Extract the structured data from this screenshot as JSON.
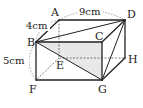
{
  "figure": {
    "type": "rectangular prism (cuboid)",
    "vertices": {
      "A": {
        "label": "A",
        "x": 59,
        "y": 20
      },
      "B": {
        "label": "B",
        "x": 36,
        "y": 42
      },
      "C": {
        "label": "C",
        "x": 102,
        "y": 42
      },
      "D": {
        "label": "D",
        "x": 125,
        "y": 20
      },
      "E": {
        "label": "E",
        "x": 59,
        "y": 58
      },
      "F": {
        "label": "F",
        "x": 36,
        "y": 80
      },
      "G": {
        "label": "G",
        "x": 102,
        "y": 80
      },
      "H": {
        "label": "H",
        "x": 125,
        "y": 58
      }
    },
    "dimensions": {
      "AD": "9cm",
      "AB": "4cm",
      "BF": "5cm"
    },
    "solid_edges": [
      "AD",
      "AB",
      "BC",
      "CD",
      "BF",
      "FG",
      "CG",
      "DH",
      "GH",
      "BD",
      "BG",
      "DG"
    ],
    "hidden_edges": [
      "AE",
      "EF",
      "EH"
    ],
    "shaded_region": "BCG",
    "colors": {
      "line": "#222222",
      "shade": "#e6e6e6",
      "dashed": "#555555"
    }
  }
}
